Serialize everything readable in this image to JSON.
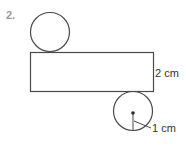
{
  "problem": {
    "number": "2."
  },
  "figure": {
    "rectangle": {
      "label": "2 cm",
      "dimension": "height"
    },
    "circles": [
      {
        "position": "top",
        "labeled": false
      },
      {
        "position": "bottom",
        "label": "1 cm",
        "dimension": "radius"
      }
    ],
    "stroke_color": "#4a4a4a",
    "number_color": "#9a9a9a"
  }
}
